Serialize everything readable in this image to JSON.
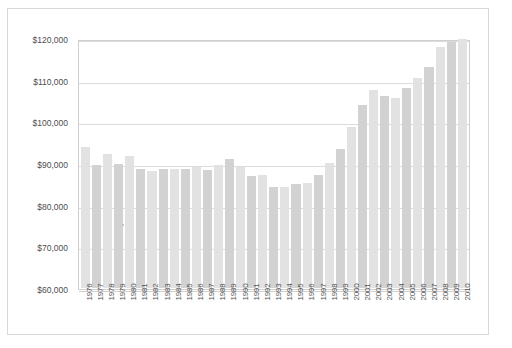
{
  "chart_data": {
    "type": "bar",
    "title": "",
    "subtitle": "",
    "xlabel": "",
    "ylabel": "",
    "grid": true,
    "legend": false,
    "legend_position": "none",
    "ylim": [
      60000,
      120000
    ],
    "ytick_labels": [
      "$120,000",
      "$110,000",
      "$100,000",
      "$90,000",
      "$80,000",
      "$70,000",
      "$60,000"
    ],
    "ytick_values": [
      120000,
      110000,
      100000,
      90000,
      80000,
      70000,
      60000
    ],
    "categories": [
      "1976",
      "1977",
      "1978",
      "1979",
      "1980",
      "1981",
      "1982",
      "1983",
      "1984",
      "1985",
      "1986",
      "1987",
      "1988",
      "1989",
      "1990",
      "1991",
      "1992",
      "1993",
      "1994",
      "1995",
      "1996",
      "1997",
      "1998",
      "1999",
      "2000",
      "2001",
      "2002",
      "2003",
      "2004",
      "2005",
      "2006",
      "2007",
      "2008",
      "2009",
      "2010"
    ],
    "values": [
      94000,
      89800,
      92400,
      89900,
      92000,
      88900,
      88300,
      88700,
      88800,
      88700,
      89200,
      88600,
      89700,
      91200,
      89200,
      87200,
      87400,
      84500,
      84600,
      85300,
      85400,
      87400,
      90200,
      93500,
      98900,
      104200,
      107800,
      106400,
      105900,
      108300,
      110600,
      113400,
      118000,
      119300,
      120000
    ],
    "bar_color_light": "#e2e2e2",
    "bar_color_dark": "#d2d2d2",
    "gridline_color": "#dcdcdc",
    "axis_color": "#cfcfcf",
    "background_color": "#ffffff",
    "text_color": "#4d4d4d"
  }
}
